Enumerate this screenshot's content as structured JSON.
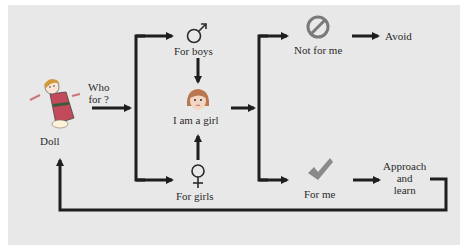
{
  "diagram": {
    "type": "flowchart",
    "background": "#e8e8e8",
    "line_color": "#1e1e1e",
    "nodes": {
      "doll": {
        "label": "Doll",
        "icon": "doll-icon"
      },
      "who_for": {
        "label_line1": "Who",
        "label_line2": "for ?"
      },
      "for_boys": {
        "label": "For boys",
        "icon": "male-symbol-icon"
      },
      "i_am_a_girl": {
        "label": "I am a girl",
        "icon": "girl-face-icon"
      },
      "for_girls": {
        "label": "For girls",
        "icon": "female-symbol-icon"
      },
      "not_for_me": {
        "label": "Not for me",
        "icon": "prohibited-icon"
      },
      "avoid": {
        "label": "Avoid"
      },
      "for_me": {
        "label": "For me",
        "icon": "checkmark-icon"
      },
      "approach_and_learn": {
        "line1": "Approach",
        "line2": "and",
        "line3": "learn"
      }
    },
    "edges": [
      {
        "from": "doll",
        "to": "branch_who_for",
        "label": "Who for ?"
      },
      {
        "from": "branch_who_for",
        "to": "for_boys"
      },
      {
        "from": "branch_who_for",
        "to": "for_girls"
      },
      {
        "from": "for_boys",
        "to": "i_am_a_girl"
      },
      {
        "from": "for_girls",
        "to": "i_am_a_girl"
      },
      {
        "from": "i_am_a_girl",
        "to": "branch_match"
      },
      {
        "from": "branch_match",
        "to": "not_for_me"
      },
      {
        "from": "branch_match",
        "to": "for_me"
      },
      {
        "from": "not_for_me",
        "to": "avoid"
      },
      {
        "from": "for_me",
        "to": "approach_and_learn"
      },
      {
        "from": "approach_and_learn",
        "to": "doll"
      }
    ]
  }
}
